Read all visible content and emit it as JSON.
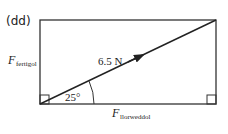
{
  "part_label": "(dd)",
  "diagram": {
    "resultant_label": "6.5 N",
    "angle_label": "25°",
    "vertical_force": {
      "symbol": "F",
      "subscript": "fertigol"
    },
    "horizontal_force": {
      "symbol": "F",
      "subscript": "llorweddol"
    },
    "line_color": "#222222"
  }
}
